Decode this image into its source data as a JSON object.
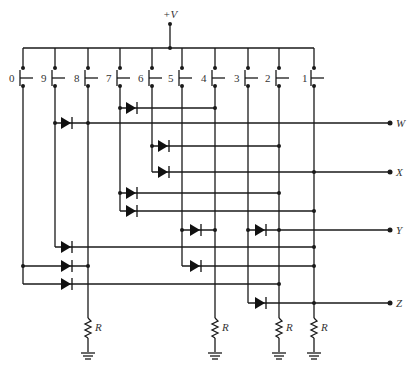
{
  "diagram": {
    "supply_label": "+V",
    "switches": [
      {
        "label": "0",
        "x": 23
      },
      {
        "label": "9",
        "x": 55
      },
      {
        "label": "8",
        "x": 88
      },
      {
        "label": "7",
        "x": 120
      },
      {
        "label": "6",
        "x": 152
      },
      {
        "label": "5",
        "x": 182
      },
      {
        "label": "4",
        "x": 215
      },
      {
        "label": "3",
        "x": 248
      },
      {
        "label": "2",
        "x": 279
      },
      {
        "label": "1",
        "x": 314
      }
    ],
    "outputs": [
      {
        "label": "W",
        "y": 123
      },
      {
        "label": "X",
        "y": 172
      },
      {
        "label": "Y",
        "y": 230
      },
      {
        "label": "Z",
        "y": 303
      }
    ],
    "resistor_label": "R",
    "resistors": [
      {
        "label": "R",
        "column": "8"
      },
      {
        "label": "R",
        "column": "4"
      },
      {
        "label": "R",
        "column": "2"
      },
      {
        "label": "R",
        "column": "1"
      }
    ],
    "diode_rows": [
      {
        "from_switch": "7",
        "y": 108,
        "to_column": "4"
      },
      {
        "from_switch": "9",
        "y": 123,
        "to_output": "W"
      },
      {
        "from_switch": "6",
        "y": 146,
        "to_column": "2"
      },
      {
        "from_switch": "6",
        "y": 172,
        "to_output": "X"
      },
      {
        "from_switch": "7",
        "y": 193,
        "to_column": "2"
      },
      {
        "from_switch": "7",
        "y": 211,
        "to_column": "1"
      },
      {
        "from_switch": "5",
        "y": 230,
        "to_column": "4"
      },
      {
        "from_switch": "3",
        "y": 230,
        "to_output": "Y"
      },
      {
        "from_switch": "9",
        "y": 247,
        "to_column": "1"
      },
      {
        "from_switch": "0",
        "y": 266,
        "to_column": "8"
      },
      {
        "from_switch": "5",
        "y": 266,
        "to_column": "1"
      },
      {
        "from_switch": "0",
        "y": 284,
        "to_column": "2"
      },
      {
        "from_switch": "3",
        "y": 303,
        "to_output": "Z"
      }
    ]
  }
}
